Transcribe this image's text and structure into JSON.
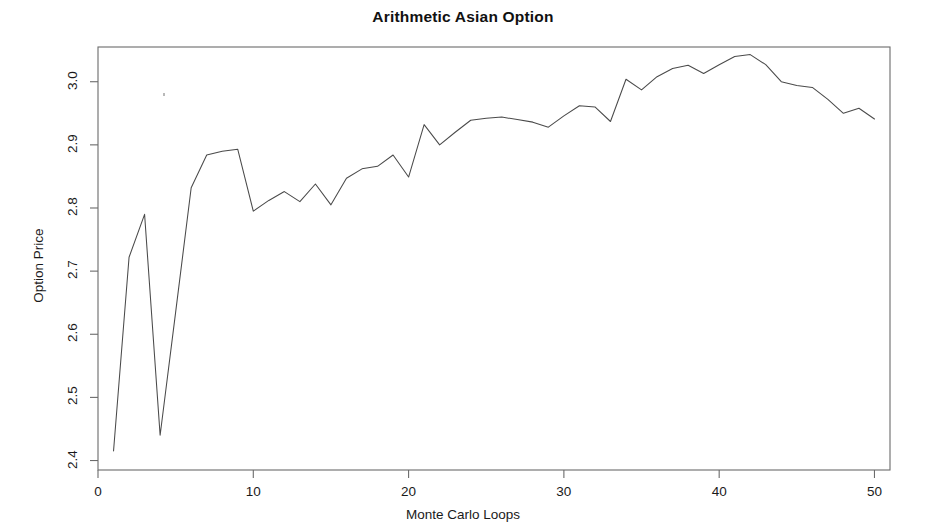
{
  "figure": {
    "title": "Arithmetic Asian Option",
    "background_color": "#ffffff",
    "line_color": "#4a4a4a",
    "frame_color": "#6b6b6b"
  },
  "axes": {
    "x_title": "Monte Carlo Loops",
    "y_title": "Option Price",
    "x_ticks": [
      "0",
      "10",
      "20",
      "30",
      "40",
      "50"
    ],
    "y_ticks": [
      "2.4",
      "2.5",
      "2.6",
      "2.7",
      "2.8",
      "2.9",
      "3.0"
    ]
  },
  "artifacts": {
    "speck_label": "scan-speck"
  },
  "chart_data": {
    "type": "line",
    "title": "Arithmetic Asian Option",
    "xlabel": "Monte Carlo Loops",
    "ylabel": "Option Price",
    "xlim": [
      0,
      51
    ],
    "ylim": [
      2.385,
      3.055
    ],
    "grid": false,
    "legend": "none",
    "x_ticks": [
      0,
      10,
      20,
      30,
      40,
      50
    ],
    "y_ticks": [
      2.4,
      2.5,
      2.6,
      2.7,
      2.8,
      2.9,
      3.0
    ],
    "x": [
      1,
      2,
      3,
      4,
      5,
      6,
      7,
      8,
      9,
      10,
      11,
      12,
      13,
      14,
      15,
      16,
      17,
      18,
      19,
      20,
      21,
      22,
      23,
      24,
      25,
      26,
      27,
      28,
      29,
      30,
      31,
      32,
      33,
      34,
      35,
      36,
      37,
      38,
      39,
      40,
      41,
      42,
      43,
      44,
      45,
      46,
      47,
      48,
      49,
      50
    ],
    "values": [
      2.415,
      2.722,
      2.79,
      2.44,
      2.635,
      2.832,
      2.884,
      2.89,
      2.893,
      2.795,
      2.812,
      2.826,
      2.81,
      2.838,
      2.805,
      2.847,
      2.862,
      2.866,
      2.884,
      2.849,
      2.932,
      2.9,
      2.92,
      2.939,
      2.942,
      2.944,
      2.94,
      2.936,
      2.928,
      2.946,
      2.962,
      2.96,
      2.937,
      3.004,
      2.987,
      3.008,
      3.021,
      3.026,
      3.013,
      3.027,
      3.04,
      3.043,
      3.027,
      3.0,
      2.994,
      2.991,
      2.972,
      2.95,
      2.958,
      2.941
    ],
    "series": [
      {
        "name": "Arithmetic Asian option price",
        "values": [
          2.415,
          2.722,
          2.79,
          2.44,
          2.635,
          2.832,
          2.884,
          2.89,
          2.893,
          2.795,
          2.812,
          2.826,
          2.81,
          2.838,
          2.805,
          2.847,
          2.862,
          2.866,
          2.884,
          2.849,
          2.932,
          2.9,
          2.92,
          2.939,
          2.942,
          2.944,
          2.94,
          2.936,
          2.928,
          2.946,
          2.962,
          2.96,
          2.937,
          3.004,
          2.987,
          3.008,
          3.021,
          3.026,
          3.013,
          3.027,
          3.04,
          3.043,
          3.027,
          3.0,
          2.994,
          2.991,
          2.972,
          2.95,
          2.958,
          2.941
        ]
      }
    ]
  }
}
